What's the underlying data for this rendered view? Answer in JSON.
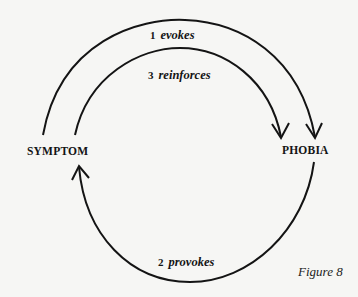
{
  "diagram": {
    "nodes": {
      "symptom": "SYMPTOM",
      "phobia": "PHOBIA"
    },
    "edges": [
      {
        "number": "1",
        "label": "evokes",
        "from": "SYMPTOM",
        "to": "PHOBIA"
      },
      {
        "number": "2",
        "label": "provokes",
        "from": "PHOBIA",
        "to": "SYMPTOM"
      },
      {
        "number": "3",
        "label": "reinforces",
        "from": "SYMPTOM",
        "to": "PHOBIA"
      }
    ],
    "caption": "Figure 8"
  },
  "colors": {
    "ink": "#141414",
    "paper": "#f6f6f4"
  }
}
